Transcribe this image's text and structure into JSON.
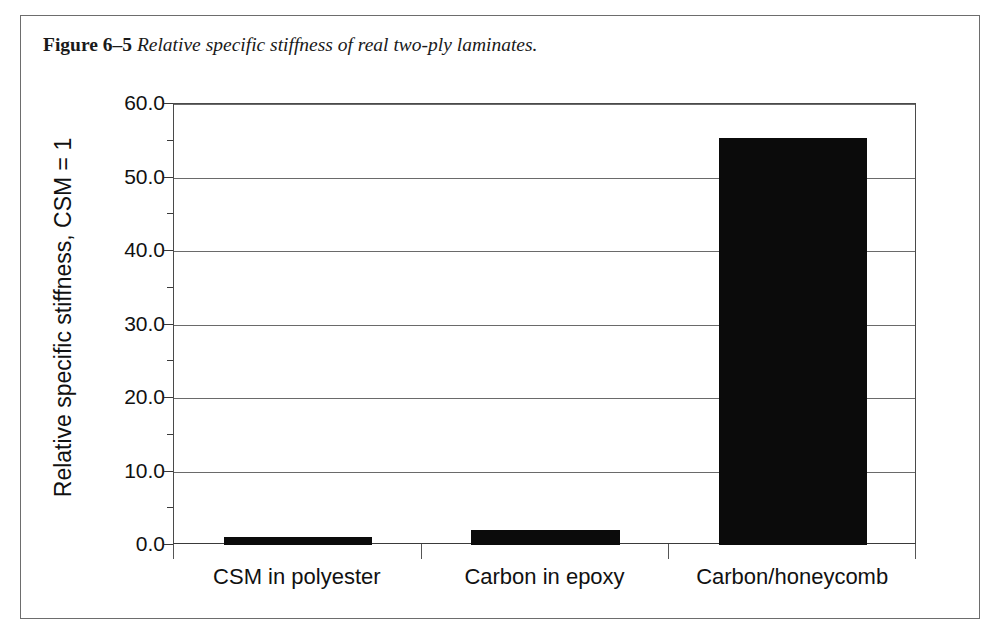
{
  "figure": {
    "label": "Figure 6–5",
    "caption": "Relative specific stiffness of real two-ply laminates."
  },
  "chart_data": {
    "type": "bar",
    "title": "",
    "xlabel": "",
    "ylabel": "Relative specific stiffness, CSM = 1",
    "categories": [
      "CSM in polyester",
      "Carbon in epoxy",
      "Carbon/honeycomb"
    ],
    "values": [
      1.1,
      2.1,
      55.4
    ],
    "ylim": [
      0.0,
      60.0
    ],
    "ytick_labels": [
      "0.0",
      "10.0",
      "20.0",
      "30.0",
      "40.0",
      "50.0",
      "60.0"
    ],
    "ytick_values": [
      0.0,
      10.0,
      20.0,
      30.0,
      40.0,
      50.0,
      60.0
    ],
    "yminor_values": [
      5.0,
      15.0,
      25.0,
      35.0,
      45.0,
      55.0
    ],
    "grid": true,
    "legend": false,
    "bar_color": "#0b0b0b",
    "axis_color": "#3a3a3a",
    "grid_color": "#6a6a6a",
    "background": "#ffffff"
  }
}
